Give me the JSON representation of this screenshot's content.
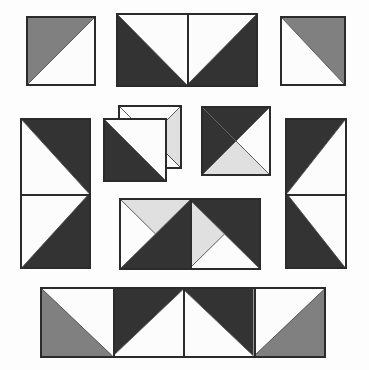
{
  "canvas": {
    "width": 369,
    "height": 370,
    "background": "#fdfdfd",
    "title": "Half-Square Triangle Block Layout"
  },
  "palette": {
    "dark": "#333333",
    "gray": "#808080",
    "light": "#e0e0e0",
    "white": "#fcfcfc",
    "border": "#2b2b2b",
    "hairline": "#4a4a4a"
  },
  "pieces": [
    {
      "id": "piece-top-left-square",
      "name": "top-left-square",
      "x": 26,
      "y": 16,
      "w": 70,
      "h": 70,
      "cols": 1,
      "rows": 1,
      "cells": [
        {
          "name": "hst-gray-upper-left",
          "pattern": "diag-tlbr",
          "a": "gray",
          "b": "white"
        }
      ]
    },
    {
      "id": "piece-top-center-rect",
      "name": "top-center-rectangle",
      "x": 116,
      "y": 13,
      "w": 142,
      "h": 74,
      "cols": 2,
      "rows": 1,
      "cells": [
        {
          "name": "hst-dark-lower-left",
          "pattern": "diag-trbl",
          "a": "white",
          "b": "dark"
        },
        {
          "name": "hst-dark-lower-right",
          "pattern": "diag-tlbr",
          "a": "white",
          "b": "dark"
        }
      ]
    },
    {
      "id": "piece-top-right-square",
      "name": "top-right-square",
      "x": 280,
      "y": 16,
      "w": 66,
      "h": 70,
      "cols": 1,
      "rows": 1,
      "cells": [
        {
          "name": "hst-gray-upper-right",
          "pattern": "diag-trbl",
          "a": "gray",
          "b": "white"
        }
      ]
    },
    {
      "id": "piece-left-tall-rect",
      "name": "left-tall-rectangle",
      "x": 20,
      "y": 118,
      "w": 71,
      "h": 151,
      "cols": 1,
      "rows": 2,
      "cells": [
        {
          "name": "hst-dark-upper-right",
          "pattern": "diag-trbl",
          "a": "dark",
          "b": "white"
        },
        {
          "name": "hst-dark-lower-right",
          "pattern": "diag-tlbr",
          "a": "white",
          "b": "dark"
        }
      ]
    },
    {
      "id": "piece-mid-overlap-back",
      "name": "mid-quarter-square-back",
      "x": 118,
      "y": 105,
      "w": 64,
      "h": 64,
      "cols": 1,
      "rows": 1,
      "cells": [
        {
          "name": "qst-white-top-light-right",
          "pattern": "quarter-tl-white-r-light",
          "a": "white",
          "b": "light"
        }
      ]
    },
    {
      "id": "piece-mid-overlap-front",
      "name": "mid-dark-triangle-front",
      "x": 103,
      "y": 118,
      "w": 64,
      "h": 64,
      "cols": 1,
      "rows": 1,
      "cells": [
        {
          "name": "hst-dark-lower-left",
          "pattern": "diag-trbl-dark-only",
          "a": "dark",
          "b": "white"
        }
      ]
    },
    {
      "id": "piece-mid-right-square",
      "name": "mid-right-square",
      "x": 201,
      "y": 106,
      "w": 70,
      "h": 70,
      "cols": 1,
      "rows": 1,
      "cells": [
        {
          "name": "qst-dark-top-light-bottom",
          "pattern": "quarter-tl-dark-b-light",
          "a": "dark",
          "b": "light"
        }
      ]
    },
    {
      "id": "piece-right-tall-rect",
      "name": "right-tall-rectangle",
      "x": 285,
      "y": 118,
      "w": 62,
      "h": 151,
      "cols": 1,
      "rows": 2,
      "cells": [
        {
          "name": "hst-dark-upper-left",
          "pattern": "diag-tlbr",
          "a": "dark",
          "b": "white"
        },
        {
          "name": "hst-dark-lower-left",
          "pattern": "diag-trbl",
          "a": "white",
          "b": "dark"
        }
      ]
    },
    {
      "id": "piece-center-rect",
      "name": "center-rectangle",
      "x": 119,
      "y": 198,
      "w": 142,
      "h": 72,
      "cols": 2,
      "rows": 1,
      "cells": [
        {
          "name": "qst-light-top-dark-right",
          "pattern": "quarter-t-light-r-dark",
          "a": "light",
          "b": "dark"
        },
        {
          "name": "qst-dark-top-light-left",
          "pattern": "quarter-t-dark-l-light",
          "a": "dark",
          "b": "light"
        }
      ]
    },
    {
      "id": "piece-bottom-rect",
      "name": "bottom-rectangle",
      "x": 40,
      "y": 287,
      "w": 286,
      "h": 71,
      "cols": 4,
      "rows": 1,
      "cells": [
        {
          "name": "hst-gray-lower-left",
          "pattern": "diag-trbl",
          "a": "white",
          "b": "gray"
        },
        {
          "name": "hst-dark-upper-left",
          "pattern": "diag-tlbr",
          "a": "dark",
          "b": "white"
        },
        {
          "name": "hst-dark-upper-right",
          "pattern": "diag-trbl",
          "a": "dark",
          "b": "white"
        },
        {
          "name": "hst-gray-lower-right",
          "pattern": "diag-tlbr",
          "a": "white",
          "b": "gray"
        }
      ]
    }
  ]
}
